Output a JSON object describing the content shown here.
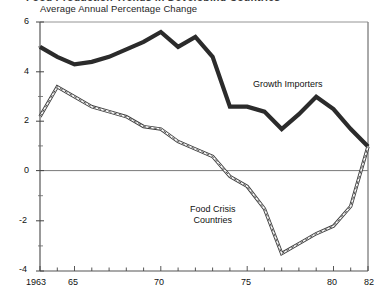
{
  "title_clipped": "Food Production Trends in Developing Countries",
  "subtitle": "Average Annual Percentage Change",
  "axes": {
    "y_ticks": [
      "6",
      "4",
      "2",
      "0",
      "-2",
      "-4"
    ],
    "x_ticks": [
      "1963",
      "65",
      "70",
      "75",
      "80",
      "82"
    ]
  },
  "series_labels": {
    "growth_importers": "Growth Importers",
    "food_crisis_line1": "Food Crisis",
    "food_crisis_line2": "Countries"
  },
  "colors": {
    "ink": "#1a1a1a",
    "frame": "#555555",
    "zero_line": "#7a7a7a",
    "thick_series": "#2b2b2b",
    "thin_series": "#3c3c3c"
  },
  "chart_data": {
    "type": "line",
    "title": "Average Annual Percentage Change",
    "xlabel": "",
    "ylabel": "Average Annual Percentage Change",
    "xlim": [
      1963,
      1982
    ],
    "ylim": [
      -4,
      6
    ],
    "yticks": [
      -4,
      -2,
      0,
      2,
      4,
      6
    ],
    "xticks": [
      1963,
      1965,
      1970,
      1975,
      1980,
      1982
    ],
    "grid": false,
    "legend": "inline-annotations",
    "zero_reference_line": 0,
    "x": [
      1963,
      1964,
      1965,
      1966,
      1967,
      1968,
      1969,
      1970,
      1971,
      1972,
      1973,
      1974,
      1975,
      1976,
      1977,
      1978,
      1979,
      1980,
      1981,
      1982
    ],
    "series": [
      {
        "name": "Growth Importers",
        "style": "thick-solid",
        "values": [
          5.0,
          4.6,
          4.3,
          4.4,
          4.6,
          4.9,
          5.2,
          5.6,
          5.0,
          5.4,
          4.6,
          2.6,
          2.6,
          2.4,
          1.7,
          2.3,
          3.0,
          2.5,
          1.7,
          1.0
        ]
      },
      {
        "name": "Food Crisis Countries",
        "style": "thin-double-line",
        "values": [
          2.2,
          3.4,
          3.0,
          2.6,
          2.4,
          2.2,
          1.8,
          1.7,
          1.2,
          0.9,
          0.6,
          -0.2,
          -0.6,
          -1.5,
          -3.3,
          -2.9,
          -2.5,
          -2.2,
          -1.4,
          1.0
        ]
      }
    ]
  }
}
